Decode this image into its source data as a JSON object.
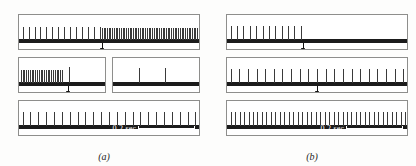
{
  "figure": {
    "top_cut_text": "",
    "row_labels": [
      "1",
      "2",
      "3"
    ],
    "scale_label": "0.2 sec",
    "captions": {
      "a": "(a)",
      "b": "(b)"
    },
    "colors": {
      "baseline": "#1b1b1b",
      "spike": "#3a3a3a",
      "box_border": "#8e8e8c",
      "background": "#fdfdfc",
      "scalebar": "#ffffff"
    }
  },
  "chart_data": {
    "type": "scatter",
    "title": "",
    "subtitle": "",
    "xlabel": "time",
    "ylabel": "",
    "grid": false,
    "legend": "none",
    "xlim": [
      0,
      100
    ],
    "scale_bar": {
      "label": "0.2 sec",
      "x_start": 52,
      "x_end": 86
    },
    "panels": [
      {
        "id": "a",
        "caption": "(a)",
        "rows": [
          {
            "label": "1",
            "split": false,
            "arrow_x": 46,
            "segments": [
              {
                "x_start": 0,
                "x_end": 100,
                "spike_start": 2,
                "spike_end": 45,
                "count": 14,
                "density": "sparse",
                "height": 13
              },
              {
                "x_start": 0,
                "x_end": 100,
                "spike_start": 46,
                "spike_end": 99,
                "count": 56,
                "density": "dense",
                "height": 12
              }
            ]
          },
          {
            "label": "2",
            "split": true,
            "arrow_x": 26,
            "gap_x": 48,
            "segments": [
              {
                "x_start": 0,
                "x_end": 46,
                "spike_start": 1,
                "spike_end": 23,
                "count": 24,
                "density": "dense",
                "height": 13
              },
              {
                "x_start": 0,
                "x_end": 46,
                "spike_start": 27,
                "spike_end": 27,
                "count": 1,
                "density": "single",
                "height": 16
              },
              {
                "x_start": 54,
                "x_end": 100,
                "spike_start": 68,
                "spike_end": 82,
                "count": 2,
                "density": "sparse",
                "height": 15
              }
            ]
          },
          {
            "label": "3",
            "split": false,
            "arrow_x": null,
            "segments": [
              {
                "x_start": 0,
                "x_end": 100,
                "spike_start": 2,
                "spike_end": 98,
                "count": 23,
                "density": "regular",
                "height": 14
              }
            ]
          }
        ]
      },
      {
        "id": "b",
        "caption": "(b)",
        "rows": [
          {
            "label": "1",
            "split": false,
            "arrow_x": 42,
            "segments": [
              {
                "x_start": 0,
                "x_end": 100,
                "spike_start": 2,
                "spike_end": 41,
                "count": 12,
                "density": "sparse",
                "height": 14
              }
            ]
          },
          {
            "label": "2",
            "split": false,
            "arrow_x": 50,
            "segments": [
              {
                "x_start": 0,
                "x_end": 100,
                "spike_start": 2,
                "spike_end": 98,
                "count": 21,
                "density": "regular",
                "height": 14
              }
            ]
          },
          {
            "label": "3",
            "split": false,
            "arrow_x": null,
            "segments": [
              {
                "x_start": 0,
                "x_end": 100,
                "spike_start": 2,
                "spike_end": 99,
                "count": 40,
                "density": "dense-regular",
                "height": 14
              }
            ]
          }
        ]
      }
    ]
  }
}
